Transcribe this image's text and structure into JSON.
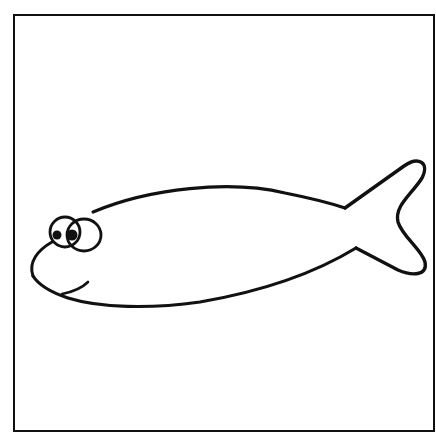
{
  "illustration": {
    "subject": "cartoon fish line drawing",
    "alt": "Simple outline drawing of a fish facing left with big eyes and a smile",
    "colors": {
      "background": "#ffffff",
      "stroke": "#111111"
    }
  }
}
